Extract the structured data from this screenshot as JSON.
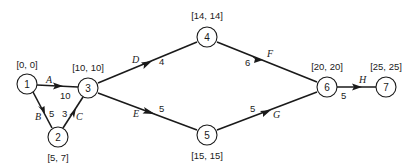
{
  "diagram": {
    "type": "activity-on-arrow network (CPM)",
    "nodes": [
      {
        "id": "1",
        "times": "[0, 0]",
        "x": 27,
        "y": 84,
        "label_x": 27,
        "label_y": 66
      },
      {
        "id": "2",
        "times": "[5, 7]",
        "x": 58,
        "y": 137,
        "label_x": 58,
        "label_y": 160
      },
      {
        "id": "3",
        "times": "[10, 10]",
        "x": 88,
        "y": 88,
        "label_x": 88,
        "label_y": 70
      },
      {
        "id": "4",
        "times": "[14, 14]",
        "x": 207,
        "y": 37,
        "label_x": 207,
        "label_y": 18
      },
      {
        "id": "5",
        "times": "[15, 15]",
        "x": 207,
        "y": 135,
        "label_x": 207,
        "label_y": 158
      },
      {
        "id": "6",
        "times": "[20, 20]",
        "x": 327,
        "y": 87,
        "label_x": 327,
        "label_y": 69
      },
      {
        "id": "7",
        "times": "[25, 25]",
        "x": 386,
        "y": 87,
        "label_x": 386,
        "label_y": 69
      }
    ],
    "edges": [
      {
        "activity": "A",
        "from": "1",
        "to": "3",
        "duration": "10"
      },
      {
        "activity": "B",
        "from": "1",
        "to": "2",
        "duration": "5"
      },
      {
        "activity": "C",
        "from": "2",
        "to": "3",
        "duration": "3"
      },
      {
        "activity": "D",
        "from": "3",
        "to": "4",
        "duration": "4"
      },
      {
        "activity": "E",
        "from": "3",
        "to": "5",
        "duration": "5"
      },
      {
        "activity": "F",
        "from": "4",
        "to": "6",
        "duration": "6"
      },
      {
        "activity": "G",
        "from": "5",
        "to": "6",
        "duration": "5"
      },
      {
        "activity": "H",
        "from": "6",
        "to": "7",
        "duration": "5"
      }
    ]
  }
}
